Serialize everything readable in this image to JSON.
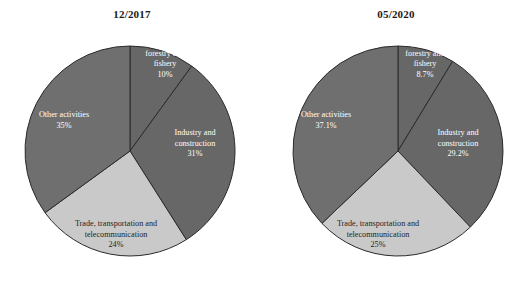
{
  "figure": {
    "background": "#ffffff",
    "panels": [
      "left",
      "right"
    ]
  },
  "colors": {
    "agriculture": "#676767",
    "industry": "#676767",
    "trade": "#c9c9c9",
    "other": "#6f6f6f",
    "slice_border": "#2b2b2b",
    "label_light_text": "#ffffff",
    "label_dark_text": "#1f1f1f",
    "title_text": "#1a1a1a"
  },
  "left": {
    "title": "12/2017",
    "labels": {
      "agriculture": "Agriculture, forestry and fishery",
      "agriculture_l1": "Agriculture,",
      "agriculture_l2": "forestry and",
      "agriculture_l3": "fishery",
      "agriculture_pct": "10%",
      "industry_l1": "Industry and",
      "industry_l2": "construction",
      "industry_pct": "31%",
      "trade_l1": "Trade, transportation and",
      "trade_l2": "telecommunication",
      "trade_pct": "24%",
      "other_l1": "Other activities",
      "other_pct": "35%"
    }
  },
  "right": {
    "title": "05/2020",
    "labels": {
      "agriculture": "Agriculture, forestry and fishery",
      "agriculture_l1": "Agriculture,",
      "agriculture_l2": "forestry and",
      "agriculture_l3": "fishery",
      "agriculture_pct": "8.7%",
      "industry_l1": "Industry and",
      "industry_l2": "construction",
      "industry_pct": "29.2%",
      "trade_l1": "Trade, transportation and",
      "trade_l2": "telecommunication",
      "trade_pct": "25%",
      "other_l1": "Other activities",
      "other_pct": "37.1%"
    }
  },
  "chart_data": [
    {
      "type": "pie",
      "title": "12/2017",
      "labels": [
        "Agriculture, forestry and fishery",
        "Industry and construction",
        "Trade, transportation and telecommunication",
        "Other activities"
      ],
      "values": [
        10,
        31,
        24,
        35
      ],
      "value_labels": [
        "10%",
        "31%",
        "24%",
        "35%"
      ],
      "units": "percent",
      "start_angle_deg": 0,
      "direction": "clockwise",
      "colors": [
        "#676767",
        "#676767",
        "#c9c9c9",
        "#6f6f6f"
      ],
      "legend": "none",
      "labels_inside_slices": true
    },
    {
      "type": "pie",
      "title": "05/2020",
      "labels": [
        "Agriculture, forestry and fishery",
        "Industry and construction",
        "Trade, transportation and telecommunication",
        "Other activities"
      ],
      "values": [
        8.7,
        29.2,
        25,
        37.1
      ],
      "value_labels": [
        "8.7%",
        "29.2%",
        "25%",
        "37.1%"
      ],
      "units": "percent",
      "start_angle_deg": 0,
      "direction": "clockwise",
      "colors": [
        "#676767",
        "#676767",
        "#c9c9c9",
        "#6f6f6f"
      ],
      "legend": "none",
      "labels_inside_slices": true
    }
  ]
}
